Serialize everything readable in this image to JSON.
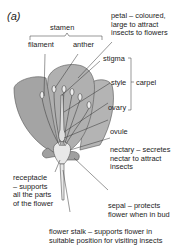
{
  "figure": {
    "panel_label": "(a)",
    "colors": {
      "petal_fill": "#a8a8a8",
      "petal_back_fill": "#b4b4b4",
      "center_fill": "#e8e8e8",
      "line": "#333333"
    },
    "labels": {
      "stamen": "stamen",
      "filament": "filament",
      "anther": "anther",
      "petal": [
        "petal – coloured,",
        "large to attract",
        "insects to flowers"
      ],
      "stigma": "stigma",
      "style": "style",
      "carpel": "carpel",
      "ovary": "ovary",
      "ovule": "ovule",
      "nectary": [
        "nectary – secretes",
        "nectar to attract",
        "insects"
      ],
      "receptacle": [
        "receptacle",
        "– supports",
        "all the parts",
        "of the flower"
      ],
      "sepal": [
        "sepal – protects",
        "flower when in bud"
      ],
      "flower_stalk": [
        "flower stalk – supports flower in",
        "suitable position for visiting insects"
      ]
    }
  }
}
